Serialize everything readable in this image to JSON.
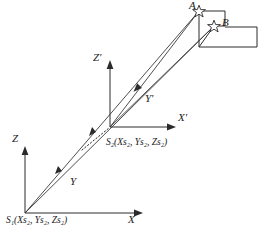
{
  "figure": {
    "type": "surveying-intersection-diagram",
    "colors": {
      "line": "#2b2b2b",
      "ray": "#3a3a3a",
      "background": "#ffffff",
      "text": "#1a1a1a"
    }
  },
  "stations": {
    "s1": {
      "name": "station-1",
      "label_prefix": "S",
      "label_sub": "1",
      "coords_text": "(Xs₂, Ys₂, Zs₂)",
      "full_label": "S₁(Xs₂, Ys₂, Zs₂)",
      "origin": {
        "x": 25,
        "y": 213
      }
    },
    "s2": {
      "name": "station-2",
      "label_prefix": "S",
      "label_sub": "2",
      "coords_text": "(Xs₂, Ys₂, Zs₂)",
      "full_label": "S₂(Xs₂, Ys₂, Zs₂)",
      "origin": {
        "x": 110,
        "y": 127
      }
    }
  },
  "axes": [
    {
      "name": "x-axis",
      "label": "X",
      "prime": false,
      "system": "s1"
    },
    {
      "name": "y-axis",
      "label": "Y",
      "prime": false,
      "system": "s1"
    },
    {
      "name": "z-axis",
      "label": "Z",
      "prime": false,
      "system": "s1"
    },
    {
      "name": "x-prime-axis",
      "label": "X'",
      "prime": true,
      "system": "s2"
    },
    {
      "name": "y-prime-axis",
      "label": "Y'",
      "prime": true,
      "system": "s2"
    },
    {
      "name": "z-prime-axis",
      "label": "Z'",
      "prime": true,
      "system": "s2"
    }
  ],
  "axis_labels": {
    "x": "X",
    "y": "Y",
    "z": "Z",
    "x_prime": "X'",
    "y_prime": "Y'",
    "z_prime": "Z'"
  },
  "targets": [
    {
      "name": "target-a",
      "label": "A",
      "marker": "star-icon",
      "x": 199,
      "y": 11
    },
    {
      "name": "target-b",
      "label": "B",
      "marker": "star-icon",
      "x": 214,
      "y": 26
    }
  ],
  "building": {
    "name": "building-outline",
    "description": "rectangular building footprint at upper right"
  },
  "rays": [
    {
      "name": "ray-s1-to-a",
      "from": "s1",
      "to": "target-a"
    },
    {
      "name": "ray-s1-to-b",
      "from": "s1",
      "to": "target-b"
    },
    {
      "name": "ray-s2-to-a",
      "from": "s2",
      "to": "target-a"
    },
    {
      "name": "ray-s2-to-b",
      "from": "s2",
      "to": "target-b"
    }
  ]
}
